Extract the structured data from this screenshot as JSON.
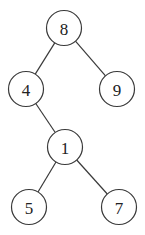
{
  "diagram": {
    "type": "binary-tree",
    "colors": {
      "stroke": "#3a3a3a",
      "text": "#222222",
      "background": "#ffffff"
    },
    "radius": 17.5,
    "nodes": [
      {
        "id": "n8",
        "label": "8",
        "cx": 64,
        "cy": 28
      },
      {
        "id": "n4",
        "label": "4",
        "cx": 26,
        "cy": 89
      },
      {
        "id": "n9",
        "label": "9",
        "cx": 117,
        "cy": 89
      },
      {
        "id": "n1",
        "label": "1",
        "cx": 65,
        "cy": 147
      },
      {
        "id": "n5",
        "label": "5",
        "cx": 29,
        "cy": 207
      },
      {
        "id": "n7",
        "label": "7",
        "cx": 119,
        "cy": 207
      }
    ],
    "edges": [
      {
        "from": "n8",
        "to": "n4"
      },
      {
        "from": "n8",
        "to": "n9"
      },
      {
        "from": "n4",
        "to": "n1"
      },
      {
        "from": "n1",
        "to": "n5"
      },
      {
        "from": "n1",
        "to": "n7"
      }
    ]
  }
}
